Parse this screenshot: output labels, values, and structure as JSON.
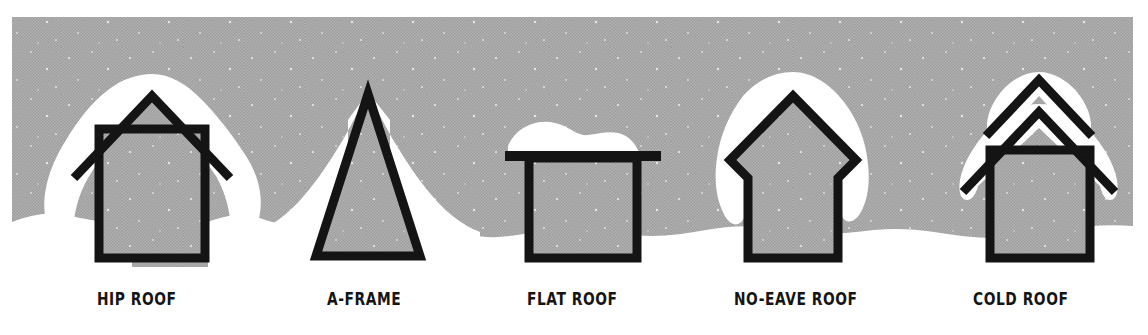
{
  "illustration": {
    "title": "Roof types and snow accumulation",
    "background_color": "#ffffff",
    "sky_color": "#a9a9a9",
    "snow_color": "#ffffff",
    "outline_color": "#141414",
    "sky_panel": {
      "x": 12,
      "y": 17,
      "width": 1121,
      "height": 250
    }
  },
  "items": [
    {
      "key": "hip-roof",
      "label": "HIP ROOF",
      "label_x": 97,
      "label_y": 306,
      "description": "Gabled house with wide overhanging eaves and a deep snow cap draping over both sides"
    },
    {
      "key": "a-frame",
      "label": "A-FRAME",
      "label_x": 327,
      "label_y": 306,
      "description": "Steep triangular A-frame with snow drifted into a mountain shape behind it"
    },
    {
      "key": "flat-roof",
      "label": "FLAT ROOF",
      "label_x": 527,
      "label_y": 306,
      "description": "Box house with a flat slab roof carrying a thick rounded mound of snow"
    },
    {
      "key": "no-eave-roof",
      "label": "NO-EAVE ROOF",
      "label_x": 734,
      "label_y": 306,
      "description": "Gabled house whose eaves notch back inward, with a tall snow cap hugging the roof"
    },
    {
      "key": "cold-roof",
      "label": "COLD ROOF",
      "label_x": 973,
      "label_y": 306,
      "description": "House with a vented double-layer roof, two stacked chevrons each holding snow"
    }
  ]
}
